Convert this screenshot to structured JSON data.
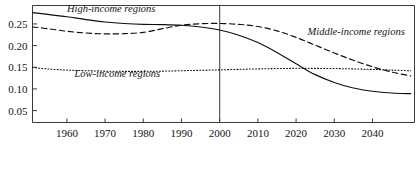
{
  "chart_data": {
    "type": "line",
    "title": "",
    "subtitle": "",
    "xlabel": "",
    "ylabel": "",
    "xlim": [
      1951,
      2051
    ],
    "ylim": [
      0.0225,
      0.2925
    ],
    "grid": false,
    "legend_position": "inline-annotations",
    "x_ticks": [
      1960,
      1970,
      1980,
      1990,
      2000,
      2010,
      2020,
      2030,
      2040
    ],
    "x_tick_labels": [
      "1960",
      "1970",
      "1980",
      "1990",
      "2000",
      "2010",
      "2020",
      "2030",
      "2040"
    ],
    "y_ticks": [
      0.05,
      0.1,
      0.15,
      0.2,
      0.25
    ],
    "y_tick_labels": [
      "0.05",
      "0.10",
      "0.15",
      "0.20",
      "0.25"
    ],
    "annotations": [
      {
        "name": "divider-year-2000",
        "type": "vline",
        "x": 2000,
        "label": ""
      }
    ],
    "series": [
      {
        "name": "High-income regions",
        "label": "High-income regions",
        "style": "solid",
        "color": "#0f0f0f",
        "label_x": 1960,
        "label_y": 0.2785,
        "x": [
          1951,
          1955,
          1960,
          1965,
          1970,
          1975,
          1980,
          1985,
          1990,
          1995,
          2000,
          2005,
          2010,
          2015,
          2020,
          2025,
          2030,
          2035,
          2040,
          2045,
          2050
        ],
        "y": [
          0.276,
          0.272,
          0.2665,
          0.26,
          0.2545,
          0.251,
          0.249,
          0.2485,
          0.247,
          0.243,
          0.236,
          0.224,
          0.207,
          0.184,
          0.158,
          0.133,
          0.115,
          0.102,
          0.0945,
          0.0905,
          0.089
        ]
      },
      {
        "name": "Middle-income regions",
        "label": "Middle-income regions",
        "style": "dashed",
        "color": "#0f0f0f",
        "label_x": 2023,
        "label_y": 0.225,
        "x": [
          1951,
          1955,
          1960,
          1965,
          1970,
          1975,
          1980,
          1985,
          1990,
          1995,
          2000,
          2005,
          2010,
          2015,
          2020,
          2025,
          2030,
          2035,
          2040,
          2045,
          2050
        ],
        "y": [
          0.243,
          0.239,
          0.233,
          0.229,
          0.227,
          0.2275,
          0.2305,
          0.239,
          0.247,
          0.2505,
          0.251,
          0.249,
          0.244,
          0.234,
          0.219,
          0.201,
          0.183,
          0.166,
          0.151,
          0.139,
          0.13
        ]
      },
      {
        "name": "Low-income regions",
        "label": "Low-income regions",
        "style": "dotted",
        "color": "#0f0f0f",
        "label_x": 1962,
        "label_y": 0.1285,
        "x": [
          1951,
          1955,
          1960,
          1965,
          1970,
          1975,
          1980,
          1985,
          1990,
          1995,
          2000,
          2005,
          2010,
          2015,
          2020,
          2025,
          2030,
          2035,
          2040,
          2045,
          2050
        ],
        "y": [
          0.1495,
          0.146,
          0.1435,
          0.142,
          0.141,
          0.1405,
          0.1405,
          0.141,
          0.142,
          0.143,
          0.144,
          0.1452,
          0.1462,
          0.147,
          0.1475,
          0.1474,
          0.147,
          0.1462,
          0.145,
          0.1435,
          0.1418
        ]
      }
    ]
  }
}
